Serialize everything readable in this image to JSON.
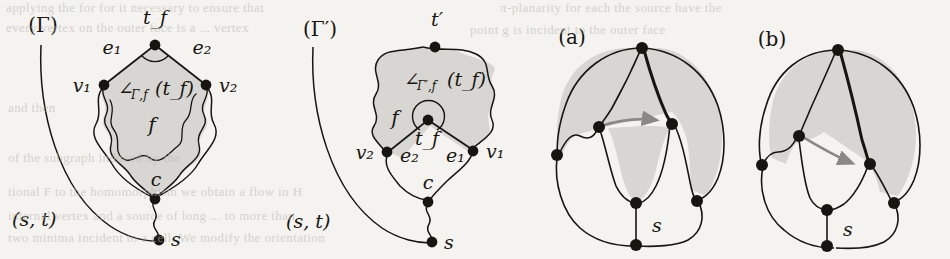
{
  "figure": {
    "background_color": "#f4f3f0",
    "ink_color": "#17150f",
    "face_fill_color": "#d8d6d2",
    "arrow_color": "#8a8884",
    "panels": [
      {
        "id": "gamma",
        "caption": "(Γ)",
        "labels": {
          "top_vertex": "t_f",
          "left_vertex": "v₁",
          "right_vertex": "v₂",
          "left_edge": "e₁",
          "right_edge": "e₂",
          "face": "f",
          "angle": "∠",
          "angle_sub": "Γ,f",
          "angle_arg": "(t_f)",
          "cut_vertex": "c",
          "source": "s",
          "st_edge": "(s, t)"
        }
      },
      {
        "id": "gamma-prime",
        "caption": "(Γ′)",
        "labels": {
          "top_vertex": "t′",
          "left_vertex": "v₂",
          "right_vertex": "v₁",
          "left_edge": "e₂",
          "right_edge": "e₁",
          "center_vertex": "t_f",
          "face": "f",
          "angle": "∠",
          "angle_sub": "Γ′,f",
          "angle_arg": "(t_f)",
          "cut_vertex": "c",
          "source": "s",
          "st_edge": "(s, t)"
        }
      },
      {
        "id": "panel-a",
        "caption": "(a)",
        "labels": {
          "source": "s"
        },
        "vertex_count": 7
      },
      {
        "id": "panel-b",
        "caption": "(b)",
        "labels": {
          "source": "s"
        },
        "vertex_count": 7
      }
    ]
  },
  "bleed_text": {
    "note": "faint show-through text from the reverse side of the scanned page",
    "lines": [
      {
        "x": 6,
        "y": 2,
        "text": "applying the  for  for  it  necessary  to  ensure  that"
      },
      {
        "x": 510,
        "y": 2,
        "text": "π-planarity  for  each    the  source  have  the"
      },
      {
        "x": 6,
        "y": 20,
        "text": "every  vertex  on  the  outer  face  is  a  ... vertex"
      },
      {
        "x": 470,
        "y": 22,
        "text": "point  g  is  incident  to  the  outer  face"
      },
      {
        "x": 8,
        "y": 100,
        "text": "and  then"
      },
      {
        "x": 8,
        "y": 150,
        "text": "of  the  subgraph  induced  by  the"
      },
      {
        "x": 8,
        "y": 184,
        "text": "tional  F  to  the  homomorphism  we  obtain  a  flow  in  H"
      },
      {
        "x": 8,
        "y": 208,
        "text": "internal  vertex  and  a  source  of  long  ...  to  more  than"
      },
      {
        "x": 8,
        "y": 230,
        "text": "two  minima  incident  to  a  cell.  We  modify  the  orientation"
      }
    ]
  }
}
